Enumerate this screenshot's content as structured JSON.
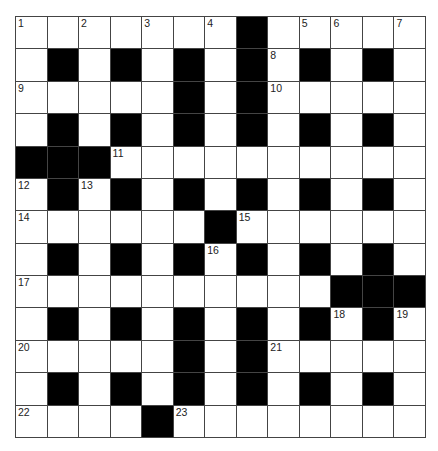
{
  "puzzle": {
    "rows": 13,
    "cols": 13,
    "layout": [
      "....... ....",
      ".#.#.#.#.#.#.",
      ".....#.#.....",
      ".#.#.#.#.#.#.",
      "###..........",
      ".#.#.#.#.#.#.",
      "......#......",
      ".#.#.#.#.#.#.",
      "..........###",
      ".#.#.#.#.#.#.",
      ".....#.#.....",
      ".#.#.#.#.#.#.",
      "....#........"
    ],
    "numbers": [
      {
        "r": 0,
        "c": 0,
        "n": "1"
      },
      {
        "r": 0,
        "c": 2,
        "n": "2"
      },
      {
        "r": 0,
        "c": 4,
        "n": "3"
      },
      {
        "r": 0,
        "c": 6,
        "n": "4"
      },
      {
        "r": 0,
        "c": 9,
        "n": "5"
      },
      {
        "r": 0,
        "c": 10,
        "n": "6"
      },
      {
        "r": 0,
        "c": 12,
        "n": "7"
      },
      {
        "r": 1,
        "c": 8,
        "n": "8"
      },
      {
        "r": 2,
        "c": 0,
        "n": "9"
      },
      {
        "r": 2,
        "c": 8,
        "n": "10"
      },
      {
        "r": 4,
        "c": 3,
        "n": "11"
      },
      {
        "r": 5,
        "c": 0,
        "n": "12"
      },
      {
        "r": 5,
        "c": 2,
        "n": "13"
      },
      {
        "r": 6,
        "c": 0,
        "n": "14"
      },
      {
        "r": 6,
        "c": 7,
        "n": "15"
      },
      {
        "r": 7,
        "c": 6,
        "n": "16"
      },
      {
        "r": 8,
        "c": 0,
        "n": "17"
      },
      {
        "r": 9,
        "c": 10,
        "n": "18"
      },
      {
        "r": 9,
        "c": 12,
        "n": "19"
      },
      {
        "r": 10,
        "c": 0,
        "n": "20"
      },
      {
        "r": 10,
        "c": 8,
        "n": "21"
      },
      {
        "r": 12,
        "c": 0,
        "n": "22"
      },
      {
        "r": 12,
        "c": 5,
        "n": "23"
      }
    ],
    "colors": {
      "block": "#000000",
      "cell": "#ffffff",
      "line": "#444444"
    }
  }
}
